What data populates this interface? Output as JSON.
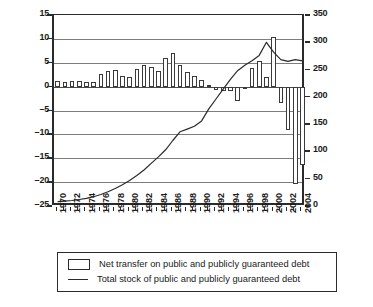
{
  "chart_data": {
    "type": "bar",
    "title": "",
    "subtitle": "",
    "xlabel": "",
    "ylabel": "",
    "y2label": "",
    "grid": true,
    "legend_position": "bottom",
    "categories": [
      "1970",
      "1971",
      "1972",
      "1973",
      "1974",
      "1975",
      "1976",
      "1977",
      "1978",
      "1979",
      "1980",
      "1981",
      "1982",
      "1983",
      "1984",
      "1985",
      "1986",
      "1987",
      "1988",
      "1989",
      "1990",
      "1991",
      "1992",
      "1993",
      "1994",
      "1995",
      "1996",
      "1997",
      "1998",
      "1999",
      "2000",
      "2001",
      "2002",
      "2003",
      "2004"
    ],
    "ylim": [
      -25,
      15
    ],
    "yticks": [
      -25,
      -20,
      -15,
      -10,
      -5,
      0,
      5,
      10,
      15
    ],
    "y2lim": [
      0,
      350
    ],
    "y2ticks": [
      0,
      50,
      100,
      150,
      200,
      250,
      300,
      350
    ],
    "xtick_labels": [
      "1970",
      "1972",
      "1974",
      "1976",
      "1978",
      "1980",
      "1982",
      "1984",
      "1986",
      "1988",
      "1990",
      "1992",
      "1994",
      "1996",
      "1998",
      "2000",
      "2002",
      "2004"
    ],
    "series": [
      {
        "name": "Net transfer on public and publicly guaranteed debt",
        "type": "bar",
        "axis": "left",
        "values": [
          1.1,
          1.0,
          1.1,
          1.1,
          1.0,
          1.0,
          2.6,
          3.3,
          3.4,
          2.2,
          2.1,
          3.6,
          4.6,
          4.2,
          3.2,
          6.0,
          7.1,
          4.5,
          3.0,
          2.3,
          1.4,
          0.3,
          -0.8,
          -1.0,
          -1.0,
          -3.0,
          -0.6,
          4.0,
          5.3,
          2.1,
          10.5,
          -3.4,
          -9.0,
          -20.5,
          -16.5
        ]
      },
      {
        "name": "Total stock of public and publicly guaranteed debt",
        "type": "line",
        "axis": "right",
        "values": [
          8,
          9,
          10,
          12,
          14,
          17,
          21,
          26,
          32,
          39,
          47,
          56,
          66,
          78,
          90,
          103,
          120,
          136,
          141,
          146,
          156,
          178,
          196,
          214,
          232,
          248,
          258,
          266,
          276,
          300,
          282,
          268,
          265,
          268,
          266
        ]
      }
    ]
  },
  "legend": {
    "items": [
      {
        "marker": "box",
        "label": "Net transfer on public and publicly guaranteed debt"
      },
      {
        "marker": "line",
        "label": "Total stock of public and publicly guaranteed debt"
      }
    ]
  },
  "colors": {
    "axis": "#2b2b2b",
    "grid": "#7d7d7d",
    "bar_fill": "#ffffff",
    "bar_stroke": "#3a3a3a",
    "line": "#2b2b2b",
    "background": "#ffffff"
  }
}
